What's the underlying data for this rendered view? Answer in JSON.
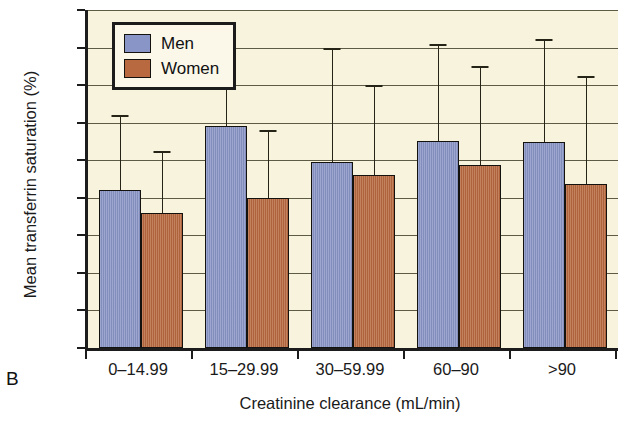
{
  "panel": {
    "letter": "B"
  },
  "legend": {
    "position": "top-left-inside",
    "entries": [
      {
        "label": "Men",
        "color": "#8995c6",
        "swatch": "men-color-swatch"
      },
      {
        "label": "Women",
        "color": "#b8693f",
        "swatch": "women-color-swatch"
      }
    ]
  },
  "axes": {
    "y": {
      "title": "Mean transferrin saturation (%)",
      "ticks": [
        0,
        5,
        10,
        15,
        20,
        25,
        30,
        35,
        40,
        45
      ],
      "tick_labels": [
        "0",
        "5",
        "10",
        "15",
        "20",
        "25",
        "30",
        "35",
        "40",
        "45"
      ],
      "min": 0,
      "max": 45
    },
    "x": {
      "title": "Creatinine clearance (mL/min)",
      "tick_labels": [
        "0–14.99",
        "15–29.99",
        "30–59.99",
        "60–90",
        ">90"
      ]
    }
  },
  "chart_data": {
    "type": "bar",
    "title": "",
    "subtitle": "",
    "xlabel": "Creatinine clearance (mL/min)",
    "ylabel": "Mean transferrin saturation (%)",
    "ylim": [
      0,
      45
    ],
    "ytick_step": 5,
    "grid": true,
    "legend_position": "upper left (inside plot)",
    "error_bars": "upper only (standard deviation)",
    "categories": [
      "0–14.99",
      "15–29.99",
      "30–59.99",
      "60–90",
      ">90"
    ],
    "series": [
      {
        "name": "Men",
        "color": "#8995c6",
        "values": [
          21.0,
          29.5,
          24.8,
          27.5,
          27.4
        ],
        "error_upper": [
          31.0,
          42.3,
          40.0,
          40.5,
          41.2
        ]
      },
      {
        "name": "Women",
        "color": "#b8693f",
        "values": [
          18.0,
          20.0,
          23.0,
          24.3,
          21.8
        ],
        "error_upper": [
          26.2,
          29.0,
          35.0,
          37.5,
          36.2
        ]
      }
    ]
  },
  "style": {
    "plot_background": "#f7f3dd",
    "axis_color": "#1c1c1c",
    "grid_color": "#5d5a46",
    "page_background": "#ffffff"
  }
}
